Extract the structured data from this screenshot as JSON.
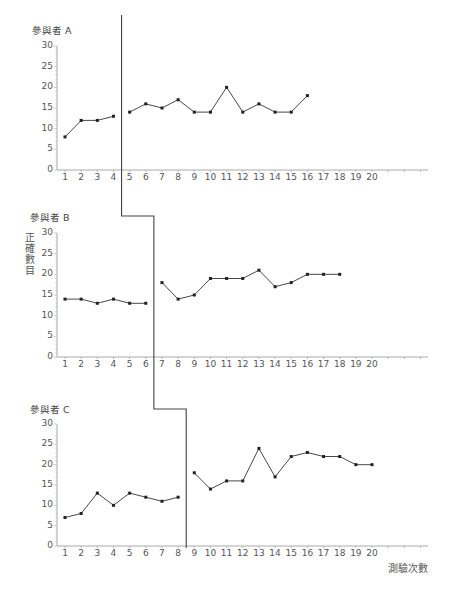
{
  "chart_data": {
    "type": "line",
    "ylabel": "正確數目",
    "xlabel": "測驗次數",
    "x_ticks": [
      1,
      2,
      3,
      4,
      5,
      6,
      7,
      8,
      9,
      10,
      11,
      12,
      13,
      14,
      15,
      16,
      17,
      18,
      19,
      20
    ],
    "y_ticks": [
      0,
      5,
      10,
      15,
      20,
      25,
      30
    ],
    "ylim": [
      0,
      30
    ],
    "xlim": [
      1,
      20
    ],
    "grid": false,
    "panels": [
      {
        "title": "參與者 A",
        "phase_change_after": 4,
        "baseline": {
          "x": [
            1,
            2,
            3,
            4
          ],
          "y": [
            8,
            12,
            12,
            13
          ]
        },
        "intervention": {
          "x": [
            5,
            6,
            7,
            8,
            9,
            10,
            11,
            12,
            13,
            14,
            15,
            16
          ],
          "y": [
            14,
            16,
            15,
            17,
            14,
            14,
            20,
            14,
            16,
            14,
            14,
            18
          ]
        }
      },
      {
        "title": "參與者 B",
        "phase_change_after": 6,
        "baseline": {
          "x": [
            1,
            2,
            3,
            4,
            5,
            6
          ],
          "y": [
            14,
            14,
            13,
            14,
            13,
            13
          ]
        },
        "intervention": {
          "x": [
            7,
            8,
            9,
            10,
            11,
            12,
            13,
            14,
            15,
            16,
            17,
            18
          ],
          "y": [
            18,
            14,
            15,
            19,
            19,
            19,
            21,
            17,
            18,
            20,
            20,
            20
          ]
        }
      },
      {
        "title": "參與者 C",
        "phase_change_after": 8,
        "baseline": {
          "x": [
            1,
            2,
            3,
            4,
            5,
            6,
            7,
            8
          ],
          "y": [
            7,
            8,
            13,
            10,
            13,
            12,
            11,
            12
          ]
        },
        "intervention": {
          "x": [
            9,
            10,
            11,
            12,
            13,
            14,
            15,
            16,
            17,
            18,
            19,
            20
          ],
          "y": [
            18,
            14,
            16,
            16,
            24,
            17,
            22,
            23,
            22,
            22,
            20,
            20
          ]
        }
      }
    ]
  },
  "labels": {
    "panel_a_title": "參與者 A",
    "panel_b_title": "參與者 B",
    "panel_c_title": "參與者 C",
    "y_axis_label": "正確數目",
    "x_axis_label": "測驗次數"
  }
}
